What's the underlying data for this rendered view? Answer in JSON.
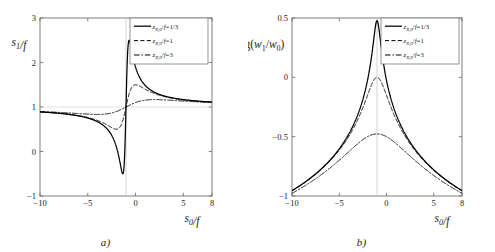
{
  "figure": {
    "panels": [
      {
        "id": "a",
        "caption": "a)",
        "xlabel": "s_0/f",
        "ylabel": "s_1/f"
      },
      {
        "id": "b",
        "caption": "b)",
        "xlabel": "s_0/f",
        "ylabel": "log(w_1/w_0)"
      }
    ],
    "legend_entries": [
      {
        "label": "z_{R,0}/f=1/3",
        "value": "1/3",
        "style": "solid",
        "color": "#000000"
      },
      {
        "label": "z_{R,0}/f=1",
        "value": "1",
        "style": "dashed",
        "color": "#000000"
      },
      {
        "label": "z_{R,0}/f=3",
        "value": "3",
        "style": "dashdot",
        "color": "#000000"
      }
    ]
  },
  "chart_data": [
    {
      "type": "line",
      "panel": "a",
      "title": "",
      "xlabel": "s_0/f",
      "ylabel": "s_1/f",
      "xlim": [
        -10,
        8
      ],
      "ylim": [
        -1,
        3
      ],
      "xticks": [
        -10,
        -5,
        0,
        5,
        8
      ],
      "xticklabels": [
        "-10",
        "-5",
        "0",
        "5",
        "8"
      ],
      "yticks": [
        -1,
        0,
        1,
        2,
        3
      ],
      "yticklabels": [
        "-1",
        "0",
        "1",
        "2",
        "3"
      ],
      "grid": false,
      "vline": -1,
      "hline": 1,
      "legend_position": "top-right",
      "formula": "s1/f = 1 + (s0/f + 1) / ((s0/f + 1)^2 + (zR/f)^2)",
      "series": [
        {
          "name": "z_{R,0}/f=1/3",
          "zR": 0.3333,
          "style": "solid",
          "x": [
            -10,
            -9,
            -8,
            -7,
            -6,
            -5,
            -4,
            -3,
            -2.5,
            -2,
            -1.7,
            -1.5,
            -1.4,
            -1.333,
            -1.2,
            -1.1,
            -1.05,
            -1.0,
            -0.95,
            -0.9,
            -0.8,
            -0.667,
            -0.5,
            -0.3,
            0,
            0.5,
            1,
            2,
            3,
            4,
            5,
            6,
            7,
            8
          ],
          "values": [
            0.8765,
            0.8759,
            0.875,
            0.8735,
            0.871,
            0.8667,
            0.8588,
            0.8421,
            0.8269,
            0.8077,
            0.7925,
            0.7857,
            0.7879,
            0.79,
            0.814,
            0.84,
            0.8,
            1.0,
            1.2,
            1.16,
            1.186,
            1.2143,
            1.3462,
            1.7671,
            1.9,
            1.6923,
            1.4878,
            1.3191,
            1.2432,
            1.1985,
            1.1685,
            1.1469,
            1.1305,
            1.1176
          ],
          "exact_points": {
            "peak_x": -1.333,
            "peak_y": 2.5,
            "trough_x": -0.667,
            "trough_y": -0.5,
            "left_edge_y": 1.12,
            "right_edge_y": 0.89
          }
        },
        {
          "name": "z_{R,0}/f=1",
          "zR": 1.0,
          "style": "dashed",
          "exact_points": {
            "peak_x": -2,
            "peak_y": 1.5,
            "trough_x": 0,
            "trough_y": 0.5,
            "left_edge_y": 1.11,
            "right_edge_y": 0.89
          }
        },
        {
          "name": "z_{R,0}/f=3",
          "zR": 3.0,
          "style": "dashdot",
          "exact_points": {
            "peak_x": -4,
            "peak_y": 1.167,
            "trough_x": 2,
            "trough_y": 0.833,
            "left_edge_y": 1.09,
            "right_edge_y": 0.9
          }
        }
      ]
    },
    {
      "type": "line",
      "panel": "b",
      "title": "",
      "xlabel": "s_0/f",
      "ylabel": "log(w_1/w_0)",
      "xlim": [
        -10,
        8
      ],
      "ylim": [
        -1,
        0.5
      ],
      "xticks": [
        -10,
        -5,
        0,
        5,
        8
      ],
      "xticklabels": [
        "-10",
        "-5",
        "0",
        "5",
        "8"
      ],
      "yticks": [
        -1,
        -0.5,
        0,
        0.5
      ],
      "yticklabels": [
        "-1",
        "-0.5",
        "0",
        "0.5"
      ],
      "grid": false,
      "vline": -1,
      "legend_position": "top-right",
      "formula": "log10(w1/w0) = -0.5*log10((s0/f + 1)^2 + (zR/f)^2)",
      "series": [
        {
          "name": "z_{R,0}/f=1/3",
          "zR": 0.3333,
          "style": "solid",
          "exact_points": {
            "peak_x": -1,
            "peak_y": 0.477,
            "left_edge_y": -0.954,
            "right_edge_y": -0.954
          }
        },
        {
          "name": "z_{R,0}/f=1",
          "zR": 1.0,
          "style": "dashed",
          "exact_points": {
            "peak_x": -1,
            "peak_y": 0.0,
            "left_edge_y": -0.957,
            "right_edge_y": -0.958
          }
        },
        {
          "name": "z_{R,0}/f=3",
          "zR": 3.0,
          "style": "dashdot",
          "exact_points": {
            "peak_x": -1,
            "peak_y": -0.477,
            "left_edge_y": -0.978,
            "right_edge_y": -0.978
          }
        }
      ]
    }
  ]
}
